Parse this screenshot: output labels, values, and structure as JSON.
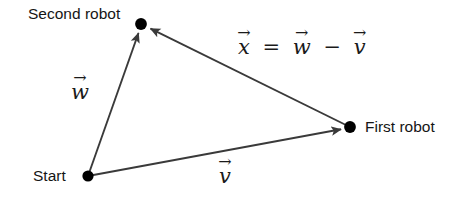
{
  "figure": {
    "background_color": "#ffffff",
    "stroke_color": "#3a3a3a",
    "dot_color": "#000000",
    "text_color": "#151515",
    "width": 464,
    "height": 199
  },
  "points": [
    {
      "id": "start",
      "label": "Start",
      "x": 88,
      "y": 176
    },
    {
      "id": "second_robot",
      "label": "Second robot",
      "x": 141,
      "y": 24
    },
    {
      "id": "first_robot",
      "label": "First robot",
      "x": 350,
      "y": 127
    }
  ],
  "vectors": [
    {
      "id": "w",
      "symbol": "w",
      "accent": "→",
      "from": "start",
      "to": "second_robot",
      "label_x": 80,
      "label_y": 93
    },
    {
      "id": "v",
      "symbol": "v",
      "accent": "→",
      "from": "start",
      "to": "first_robot",
      "label_x": 225,
      "label_y": 177
    },
    {
      "id": "x",
      "symbol": "x",
      "accent": "→",
      "from": "first_robot",
      "to": "second_robot",
      "label_x": 237,
      "label_y": 48
    }
  ],
  "equation": {
    "lhs": "x",
    "equals": "=",
    "term1": "w",
    "operator": "−",
    "term2": "v",
    "accent": "→",
    "plain_text": "x⃗ = w⃗ − v⃗"
  }
}
